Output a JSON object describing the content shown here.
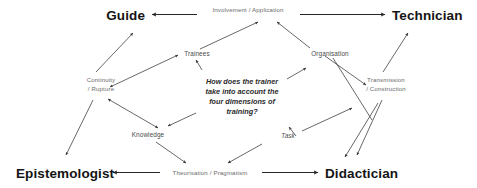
{
  "diagram": {
    "title": "How does the trainer take into account the four dimensions of training?",
    "center_question": {
      "lines": [
        "How does the trainer",
        "take into account the",
        "four dimensions of",
        "training?"
      ]
    },
    "corners": [
      {
        "id": "guide",
        "label": "Guide",
        "position": "top-left"
      },
      {
        "id": "technician",
        "label": "Technician",
        "position": "top-right"
      },
      {
        "id": "epistemologist",
        "label": "Epistemologist",
        "position": "bottom-left"
      },
      {
        "id": "didactician",
        "label": "Didactician",
        "position": "bottom-right"
      }
    ],
    "edge_labels": [
      {
        "id": "top",
        "label": "Involvement / Application",
        "lines": [
          "Involvement / Application"
        ]
      },
      {
        "id": "left",
        "label": "Continuity / Rupture",
        "lines": [
          "Continuity",
          "/ Rupture"
        ]
      },
      {
        "id": "right",
        "label": "Transmission / Construction",
        "lines": [
          "Transmission",
          "/ Construction"
        ]
      },
      {
        "id": "bottom",
        "label": "Theorisation / Pragmatism",
        "lines": [
          "Theorisation / Pragmatism"
        ]
      }
    ],
    "inner_nodes": [
      {
        "id": "trainees",
        "label": "Trainees",
        "style": "regular"
      },
      {
        "id": "organisation",
        "label": "Organisation",
        "style": "regular"
      },
      {
        "id": "knowledge",
        "label": "Knowledge",
        "style": "regular"
      },
      {
        "id": "task",
        "label": "Task",
        "style": "italic"
      }
    ],
    "colors": {
      "background": "#ffffff",
      "corner_text": "#141414",
      "edge_text": "#6b6b6b",
      "inner_text": "#4a4a4a",
      "question_text": "#2b2b2b",
      "line": "#4d4d4d",
      "line_strong": "#262626"
    }
  }
}
